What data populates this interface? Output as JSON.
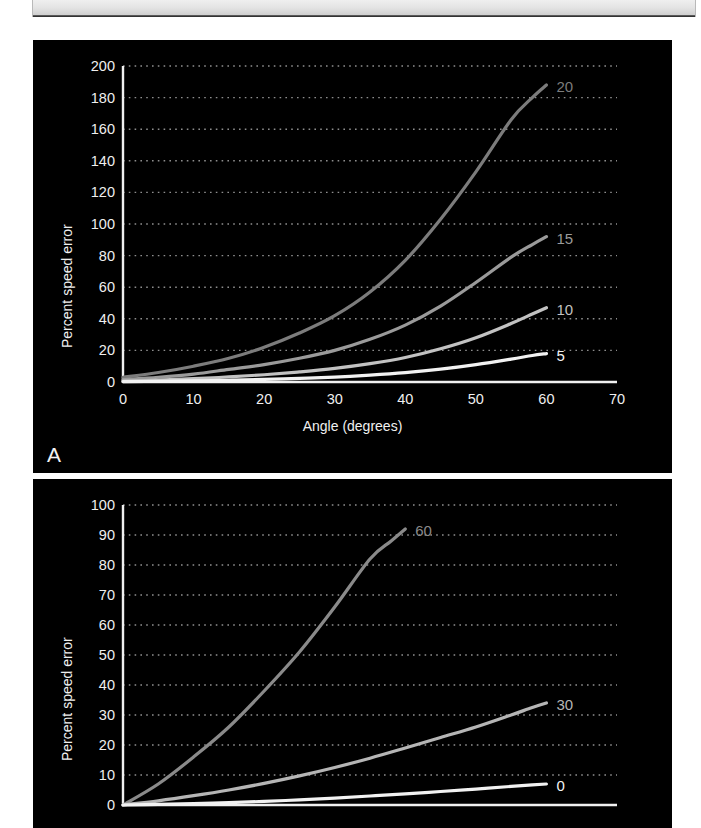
{
  "figure": {
    "panels": [
      {
        "letter": "A",
        "chart_index": 0
      },
      {
        "letter": "",
        "chart_index": 1
      }
    ]
  },
  "chart_data": [
    {
      "type": "line",
      "panel": "A",
      "title": "",
      "xlabel": "Angle (degrees)",
      "ylabel": "Percent speed error",
      "xlim": [
        0,
        70
      ],
      "ylim": [
        0,
        200
      ],
      "xticks": [
        0,
        10,
        20,
        30,
        40,
        50,
        60,
        70
      ],
      "yticks": [
        0,
        20,
        40,
        60,
        80,
        100,
        120,
        140,
        160,
        180,
        200
      ],
      "grid": "horizontal-dotted",
      "legend": "inline-end-labels",
      "series": [
        {
          "name": "20",
          "label": "20",
          "color": "#7c7c7c",
          "x": [
            0,
            5,
            10,
            15,
            20,
            25,
            30,
            35,
            40,
            45,
            50,
            55,
            58,
            60
          ],
          "values": [
            3,
            6,
            10,
            15,
            22,
            31,
            42,
            57,
            77,
            103,
            133,
            166,
            180,
            188
          ]
        },
        {
          "name": "15",
          "label": "15",
          "color": "#9a9a9a",
          "x": [
            0,
            5,
            10,
            15,
            20,
            25,
            30,
            35,
            40,
            45,
            50,
            55,
            58,
            60
          ],
          "values": [
            1.5,
            3,
            5,
            8,
            11,
            15,
            20,
            27,
            36,
            48,
            63,
            79,
            87,
            92
          ]
        },
        {
          "name": "10",
          "label": "10",
          "color": "#c2c2c2",
          "x": [
            0,
            5,
            10,
            15,
            20,
            25,
            30,
            35,
            40,
            45,
            50,
            55,
            58,
            60
          ],
          "values": [
            0.6,
            1.2,
            2.1,
            3.2,
            4.6,
            6.4,
            8.6,
            11.6,
            15.5,
            21,
            28,
            37,
            43,
            47
          ]
        },
        {
          "name": "5",
          "label": "5",
          "color": "#f2f2f2",
          "x": [
            0,
            5,
            10,
            15,
            20,
            25,
            30,
            35,
            40,
            45,
            50,
            55,
            58,
            60
          ],
          "values": [
            0.2,
            0.4,
            0.7,
            1.1,
            1.6,
            2.3,
            3.1,
            4.3,
            5.9,
            8.1,
            11,
            14.5,
            16.8,
            18
          ]
        }
      ]
    },
    {
      "type": "line",
      "panel": "B",
      "title": "",
      "xlabel": "",
      "ylabel": "Percent speed error",
      "xlim": [
        0,
        70
      ],
      "ylim": [
        0,
        100
      ],
      "xticks": [],
      "yticks": [
        0,
        10,
        20,
        30,
        40,
        50,
        60,
        70,
        80,
        90,
        100
      ],
      "grid": "horizontal-dotted",
      "legend": "inline-end-labels",
      "series": [
        {
          "name": "60",
          "label": "60",
          "color": "#8a8a8a",
          "x": [
            0,
            5,
            10,
            15,
            20,
            25,
            30,
            35,
            38,
            40
          ],
          "values": [
            0,
            7,
            16,
            26,
            38,
            51,
            66,
            82,
            88,
            92
          ]
        },
        {
          "name": "30",
          "label": "30",
          "color": "#b5b5b5",
          "x": [
            0,
            5,
            10,
            15,
            20,
            25,
            30,
            35,
            40,
            45,
            50,
            55,
            58,
            60
          ],
          "values": [
            0,
            1.4,
            3.1,
            5.0,
            7.2,
            9.7,
            12.5,
            15.6,
            19,
            22.5,
            26,
            30,
            32.5,
            34
          ]
        },
        {
          "name": "0",
          "label": "0",
          "color": "#f2f2f2",
          "x": [
            0,
            5,
            10,
            15,
            20,
            25,
            30,
            35,
            40,
            45,
            50,
            55,
            58,
            60
          ],
          "values": [
            0,
            0.2,
            0.5,
            0.8,
            1.2,
            1.7,
            2.3,
            3.0,
            3.7,
            4.5,
            5.3,
            6.2,
            6.7,
            7.0
          ]
        }
      ]
    }
  ]
}
